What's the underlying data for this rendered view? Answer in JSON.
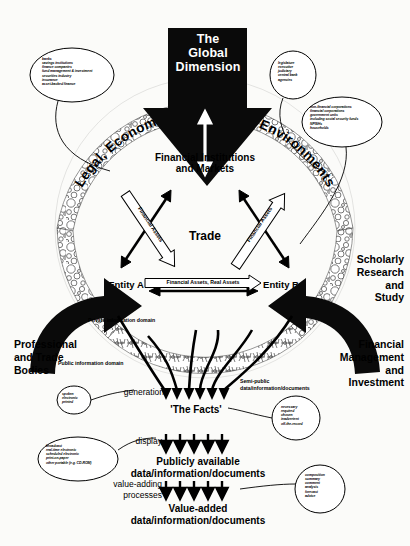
{
  "diagram": {
    "background_color": "#fbfbf9",
    "ink_color": "#000000"
  },
  "global": {
    "arrow_label_line1": "The",
    "arrow_label_line2": "Global",
    "arrow_label_line3": "Dimension"
  },
  "ring": {
    "arc_text": "Legal, Economic and Political Environments"
  },
  "core": {
    "institutions_line1": "Financial Institutions",
    "institutions_line2": "and Markets",
    "trade": "Trade",
    "entity_a": "Entity A",
    "entity_b": "Entity B",
    "left_flow_label": "Financial Assets",
    "right_flow_label": "Financial Assets",
    "horizontal_flow_label": "Financial Assets, Real Assets"
  },
  "outer_labels": {
    "professional": "Professional\nand Trade\nBodies",
    "professional_l1": "Professional",
    "professional_l2": "and Trade",
    "professional_l3": "Bodies",
    "scholarly_l1": "Scholarly",
    "scholarly_l2": "Research",
    "scholarly_l3": "and",
    "scholarly_l4": "Study",
    "financial_mgmt_l1": "Financial",
    "financial_mgmt_l2": "Management",
    "financial_mgmt_l3": "and",
    "financial_mgmt_l4": "Investment"
  },
  "domains": {
    "private": "Private information domain",
    "public": "Public information domain",
    "semi_public_l1": "Semi-public",
    "semi_public_l2": "data/information/documents"
  },
  "pipeline": {
    "generation": "generation",
    "facts": "'The Facts'",
    "display": "display",
    "publicly_l1": "Publicly available",
    "publicly_l2": "data/information/documents",
    "value_adding_l1": "value-adding",
    "value_adding_l2": "processes",
    "value_added_l1": "Value-added",
    "value_added_l2": "data/information/documents"
  },
  "callouts": {
    "institutions": {
      "name": "financial-institution-types",
      "items": [
        "banks",
        "savings institutions",
        "finance companies",
        "fund management & investment",
        "securities industry",
        "insurance",
        "asset-backed finance"
      ]
    },
    "government": {
      "name": "government-bodies",
      "items": [
        "legislature",
        "executive",
        "judiciary",
        "central bank",
        "agencies"
      ]
    },
    "sectors": {
      "name": "economic-sectors",
      "items": [
        "non-financial corporations",
        "financial corporations",
        "government units",
        "including social security funds",
        "NPISHs",
        "households"
      ]
    },
    "generation_modes": {
      "name": "generation-modes",
      "items": [
        "spoken",
        "electronic",
        "printed"
      ]
    },
    "disclosure_types": {
      "name": "disclosure-types",
      "items": [
        "necessary",
        "required",
        "chosen",
        "inadvertent",
        "off-the-record"
      ]
    },
    "display_modes": {
      "name": "display-modes",
      "items": [
        "broadcast",
        "real-time electronic",
        "scheduled electronic",
        "print-on-paper",
        "other portable (e.g. CD-ROM)"
      ]
    },
    "value_added_types": {
      "name": "value-added-types",
      "items": [
        "composition",
        "summary",
        "comment",
        "analysis",
        "forecast",
        "advice"
      ]
    }
  }
}
